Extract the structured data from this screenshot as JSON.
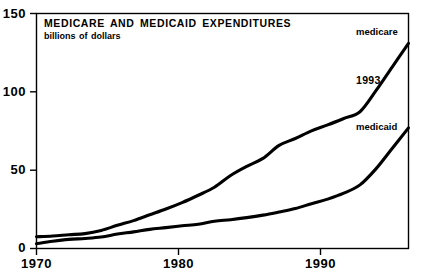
{
  "chart_data": {
    "type": "line",
    "title": "MEDICARE AND MEDICAID EXPENDITURES",
    "subtitle": "billions of dollars",
    "xlabel": "",
    "ylabel": "",
    "units": "billions of dollars",
    "xlim": [
      1970,
      1993
    ],
    "ylim": [
      0,
      150
    ],
    "yticks": [
      0,
      50,
      100,
      150
    ],
    "ytick_labels": [
      "0",
      "50",
      "100",
      "150"
    ],
    "xticks": [
      1970,
      1980,
      1990
    ],
    "xtick_labels": [
      "1970",
      "1980",
      "1990"
    ],
    "grid": false,
    "legend": "inline-end-labels",
    "end_year_annotation": "1993",
    "x": [
      1970,
      1971,
      1972,
      1973,
      1974,
      1975,
      1976,
      1977,
      1978,
      1979,
      1980,
      1981,
      1982,
      1983,
      1984,
      1985,
      1986,
      1987,
      1988,
      1989,
      1990,
      1991,
      1992,
      1993
    ],
    "series": [
      {
        "name": "medicare",
        "label": "medicare",
        "color": "#000000",
        "values": [
          7.5,
          8.0,
          8.8,
          9.5,
          11.5,
          14.8,
          17.8,
          21.5,
          25.2,
          29.3,
          34.0,
          39.1,
          46.6,
          52.4,
          57.5,
          65.8,
          70.2,
          75.1,
          78.9,
          83.0,
          87.3,
          100.9,
          116.0,
          131.0
        ]
      },
      {
        "name": "medicaid",
        "label": "medicaid",
        "color": "#000000",
        "values": [
          3.0,
          4.6,
          5.8,
          6.4,
          7.3,
          9.2,
          10.6,
          12.2,
          13.3,
          14.5,
          15.5,
          17.4,
          18.4,
          19.7,
          21.3,
          23.3,
          25.5,
          28.6,
          31.5,
          35.3,
          40.6,
          51.0,
          64.0,
          77.0
        ]
      }
    ]
  },
  "axis": {
    "ytick_0": "0",
    "ytick_50": "50",
    "ytick_100": "100",
    "ytick_150": "150",
    "xtick_1970": "1970",
    "xtick_1980": "1980",
    "xtick_1990": "1990"
  },
  "annotations": {
    "medicare_label": "medicare",
    "medicaid_label": "medicaid",
    "year_label": "1993"
  }
}
